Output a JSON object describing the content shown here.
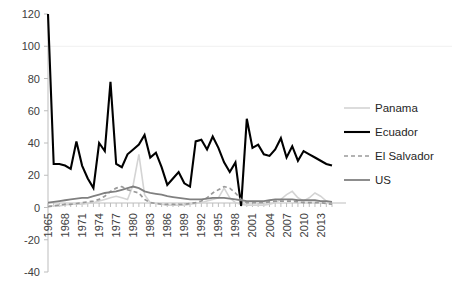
{
  "chart_data": {
    "type": "line",
    "title": "",
    "subtitle": "",
    "xlabel": "",
    "ylabel": "",
    "grid": false,
    "legend_position": "right",
    "ylim": [
      -40,
      120
    ],
    "yticks": [
      120,
      100,
      80,
      60,
      40,
      20,
      0,
      -20,
      -40
    ],
    "ytick_labels": [
      "120",
      "100",
      "80",
      "60",
      "40",
      "20",
      "0",
      "-20",
      "-40"
    ],
    "xlim": [
      1965,
      2015
    ],
    "xticks": [
      1965,
      1968,
      1971,
      1974,
      1977,
      1980,
      1983,
      1986,
      1989,
      1992,
      1995,
      1998,
      2001,
      2004,
      2007,
      2010,
      2013
    ],
    "xtick_labels": [
      "1965",
      "1968",
      "1971",
      "1974",
      "1977",
      "1980",
      "1983",
      "1986",
      "1989",
      "1992",
      "1995",
      "1998",
      "2001",
      "2004",
      "2007",
      "2010",
      "2013"
    ],
    "x_minor_tick_step": 1,
    "x": [
      1965,
      1966,
      1967,
      1968,
      1969,
      1970,
      1971,
      1972,
      1973,
      1974,
      1975,
      1976,
      1977,
      1978,
      1979,
      1980,
      1981,
      1982,
      1983,
      1984,
      1985,
      1986,
      1987,
      1988,
      1989,
      1990,
      1991,
      1992,
      1993,
      1994,
      1995,
      1996,
      1997,
      1998,
      1999,
      2000,
      2001,
      2002,
      2003,
      2004,
      2005,
      2006,
      2007,
      2008,
      2009,
      2010,
      2011,
      2012,
      2013,
      2014,
      2015
    ],
    "series": [
      {
        "name": "Panama",
        "color": "#d4d4d4",
        "width": 1.6,
        "dash": "none",
        "values": [
          1,
          1,
          1,
          1.5,
          2,
          2,
          2,
          2.5,
          3,
          4,
          5,
          6,
          7,
          6,
          5,
          14,
          33,
          8,
          3,
          2.5,
          2,
          1.5,
          1.5,
          1.5,
          1.5,
          2,
          2.5,
          3,
          4,
          5,
          6,
          12,
          6,
          3,
          2,
          1.5,
          1.5,
          1.5,
          1.5,
          2,
          3,
          5,
          8,
          10,
          6,
          4,
          6,
          9,
          7,
          4,
          3
        ]
      },
      {
        "name": "Ecuador",
        "color": "#000000",
        "width": 2.1,
        "dash": "none",
        "values": [
          120,
          27,
          27,
          26,
          24,
          41,
          26,
          18,
          12,
          40,
          35,
          78,
          27,
          25,
          33,
          36,
          39,
          45,
          31,
          34,
          25,
          14,
          18,
          22,
          15,
          13,
          41,
          42,
          36,
          44,
          37,
          28,
          22,
          28,
          1,
          55,
          37,
          39,
          33,
          32,
          36,
          43,
          31,
          38,
          29,
          35,
          33,
          31,
          29,
          27,
          26
        ]
      },
      {
        "name": "El Salvador",
        "color": "#9a9a9a",
        "width": 1.7,
        "dash": "4,3",
        "values": [
          0.5,
          1,
          1.5,
          2,
          2,
          2.5,
          3,
          3.5,
          4,
          5,
          7,
          10,
          12,
          13,
          11,
          10,
          9,
          5,
          3,
          2.5,
          2,
          2,
          2,
          2,
          2,
          2.5,
          3,
          4,
          6,
          9,
          11,
          13,
          12,
          9,
          5,
          3,
          3,
          3,
          3,
          3.5,
          4,
          4,
          4,
          4,
          3.5,
          3,
          3,
          3,
          3,
          2.5,
          2
        ]
      },
      {
        "name": "US",
        "color": "#808080",
        "width": 1.8,
        "dash": "none",
        "values": [
          3,
          3.5,
          4,
          4.5,
          5,
          5.5,
          6,
          6,
          7,
          8,
          9,
          9.5,
          10,
          11,
          12,
          13,
          12,
          10,
          9,
          8.5,
          8,
          7,
          6.5,
          6,
          5.5,
          5,
          5,
          5,
          5.5,
          6,
          6,
          6,
          5.5,
          5,
          4.5,
          4,
          4,
          4,
          4,
          4.5,
          5,
          5,
          5,
          5,
          4.5,
          4.5,
          4.5,
          4.5,
          4,
          4,
          3.5
        ]
      }
    ]
  },
  "legend": {
    "items": [
      {
        "label": "Panama"
      },
      {
        "label": "Ecuador"
      },
      {
        "label": "El Salvador"
      },
      {
        "label": "US"
      }
    ]
  }
}
